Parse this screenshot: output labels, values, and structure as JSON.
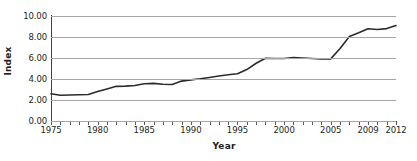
{
  "chart_data": {
    "type": "line",
    "title": "",
    "xlabel": "Year",
    "ylabel": "Index",
    "xlim": [
      1975,
      2012
    ],
    "ylim": [
      0.0,
      10.0
    ],
    "grid": true,
    "legend": "none",
    "y_ticks": [
      {
        "value": 10.0,
        "label": "10.00"
      },
      {
        "value": 8.0,
        "label": "8.00"
      },
      {
        "value": 6.0,
        "label": "6.00"
      },
      {
        "value": 4.0,
        "label": "4.00"
      },
      {
        "value": 2.0,
        "label": "2.00"
      },
      {
        "value": 0.0,
        "label": "0.00"
      }
    ],
    "x_ticks": [
      {
        "value": 1975,
        "label": "1975"
      },
      {
        "value": 1980,
        "label": "1980"
      },
      {
        "value": 1985,
        "label": "1985"
      },
      {
        "value": 1990,
        "label": "1990"
      },
      {
        "value": 1995,
        "label": "1995"
      },
      {
        "value": 2000,
        "label": "2000"
      },
      {
        "value": 2005,
        "label": "2005"
      },
      {
        "value": 2009,
        "label": "2009"
      },
      {
        "value": 2012,
        "label": "2012"
      }
    ],
    "x_minor_tick_step": 1,
    "series": [
      {
        "name": "Index",
        "color": "#2b2b2b",
        "x": [
          1975,
          1976,
          1977,
          1978,
          1979,
          1980,
          1981,
          1982,
          1983,
          1984,
          1985,
          1986,
          1987,
          1988,
          1989,
          1990,
          1991,
          1992,
          1993,
          1994,
          1995,
          1996,
          1997,
          1998,
          1999,
          2000,
          2001,
          2002,
          2003,
          2004,
          2005,
          2006,
          2007,
          2008,
          2009,
          2010,
          2011,
          2012
        ],
        "values": [
          2.6,
          2.45,
          2.48,
          2.5,
          2.52,
          2.8,
          3.05,
          3.3,
          3.32,
          3.38,
          3.55,
          3.58,
          3.5,
          3.48,
          3.8,
          3.92,
          4.02,
          4.15,
          4.28,
          4.4,
          4.5,
          4.9,
          5.5,
          5.98,
          5.95,
          5.95,
          6.05,
          6.0,
          5.95,
          5.9,
          5.92,
          6.9,
          8.05,
          8.4,
          8.78,
          8.72,
          8.8,
          9.1
        ]
      }
    ]
  },
  "colors": {
    "line": "#2b2b2b",
    "grid": "#a6a6a6",
    "axis": "#404040",
    "text": "#231f20",
    "background": "#ffffff"
  }
}
